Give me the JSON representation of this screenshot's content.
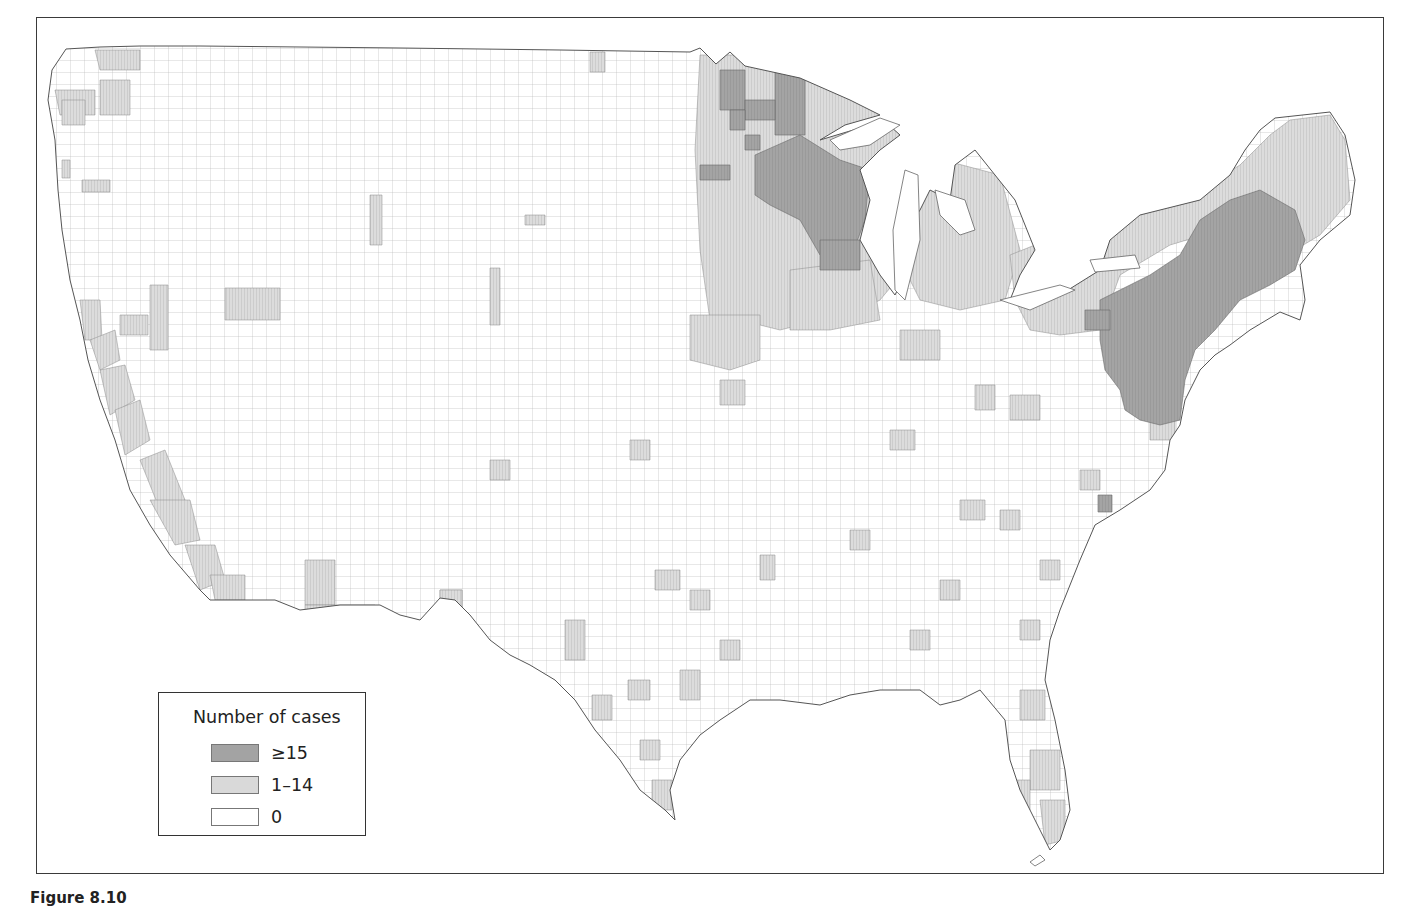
{
  "figure": {
    "caption_partial": "Figure 8.10",
    "colors": {
      "high": "#a3a3a3",
      "low": "#d9d9d9",
      "zero": "#ffffff",
      "county_border": "#8a8a8a",
      "frame_border": "#3a3a3a"
    }
  },
  "legend": {
    "title": "Number of cases",
    "items": [
      {
        "label": "≥15",
        "color": "#a3a3a3"
      },
      {
        "label": "1–14",
        "color": "#d9d9d9"
      },
      {
        "label": "0",
        "color": "#ffffff"
      }
    ]
  },
  "map": {
    "type": "choropleth",
    "geography": "Contiguous United States, county level",
    "categories": [
      "≥15",
      "1–14",
      "0"
    ],
    "high_incidence_regions": [
      "Northeast (Maine coast to Virginia: NH, MA, CT, RI, NY southeast, NJ, PA east, DE, MD)",
      "Upper Midwest (Minnesota, Wisconsin)"
    ],
    "moderate_incidence_regions": [
      "Northern New England and upstate New York",
      "Michigan, Pennsylvania west, Ohio scattered",
      "Pacific coast counties (Washington, Oregon, California)",
      "Scattered counties across the South, Texas, Florida"
    ]
  }
}
